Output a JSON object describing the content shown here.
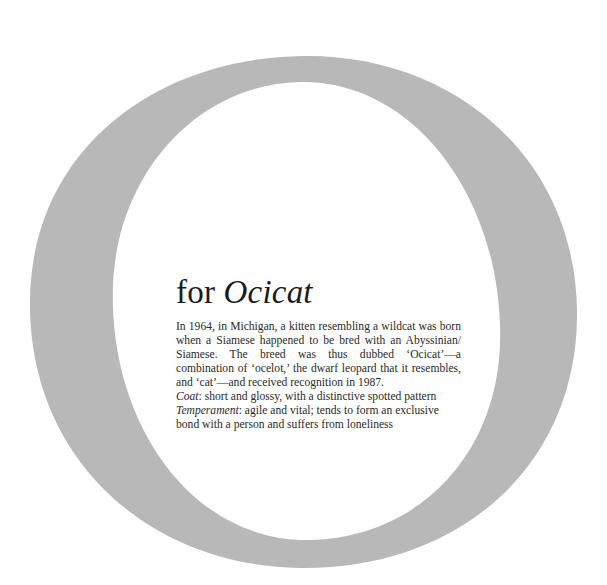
{
  "page": {
    "background_color": "#ffffff"
  },
  "big_letter": {
    "glyph": "O",
    "icon": "letter-o-ring",
    "color": "#b8b8b8"
  },
  "entry": {
    "title_prefix": "for",
    "title_breed": "Ocicat",
    "history": "In 1964, in Michigan, a kitten resembling a wildcat was born when a Siamese happened to be bred with an Abyssinian/ Siamese. The breed was thus dubbed ‘Ocicat’—a combination of ‘ocelot,’ the dwarf leopard that it resembles, and ‘cat’—and received recognition in 1987.",
    "coat_label": "Coat",
    "coat_text": ": short and glossy, with a distinctive spotted pattern",
    "temperament_label": "Temperament",
    "temperament_text": ": agile and vital; tends to form an exclusive bond with a person and suffers from loneliness"
  }
}
